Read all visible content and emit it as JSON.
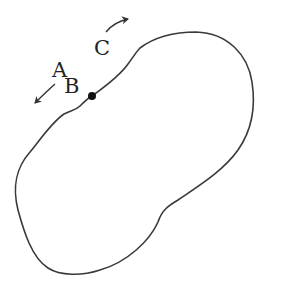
{
  "diagram": {
    "labels": {
      "a": "A",
      "b": "B",
      "c": "C"
    },
    "colors": {
      "stroke": "#3a3a3a",
      "text": "#222222",
      "background": "#ffffff"
    },
    "elements": {
      "closed_curve": "irregular closed loop",
      "point": "filled dot on curve",
      "arrow_ab": "arrow pointing down-left along curve",
      "arrow_c": "arrow pointing up-right along curve"
    }
  }
}
